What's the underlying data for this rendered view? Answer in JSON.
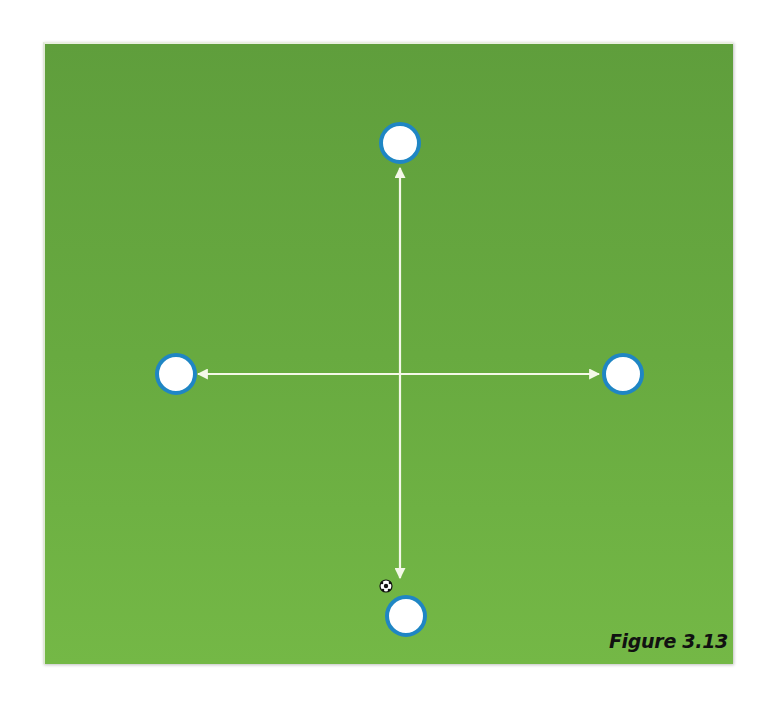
{
  "figure": {
    "caption": "Figure 3.13",
    "colors": {
      "field": "#68aa40",
      "line": "#f4f8e8",
      "cone_fill": "#ffffff",
      "cone_stroke": "#1f86c4"
    },
    "players": [
      {
        "id": "top",
        "label": ""
      },
      {
        "id": "left",
        "label": ""
      },
      {
        "id": "right",
        "label": ""
      },
      {
        "id": "bottom",
        "label": ""
      }
    ],
    "passes": [
      {
        "from": "bottom",
        "to": "top",
        "bidirectional": true
      },
      {
        "from": "left",
        "to": "right",
        "bidirectional": true
      }
    ],
    "ball": {
      "near": "bottom"
    }
  }
}
